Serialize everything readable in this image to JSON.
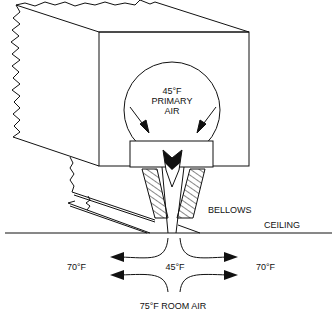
{
  "diagram": {
    "labels": {
      "primary_temp": "45°F",
      "primary_line1": "PRIMARY",
      "primary_line2": "AIR",
      "bellows": "BELLOWS",
      "ceiling": "CEILING",
      "left_temp": "70°F",
      "center_temp": "45°F",
      "right_temp": "70°F",
      "room_air": "75°F ROOM AIR"
    },
    "colors": {
      "line": "#111111",
      "background": "#ffffff"
    }
  }
}
